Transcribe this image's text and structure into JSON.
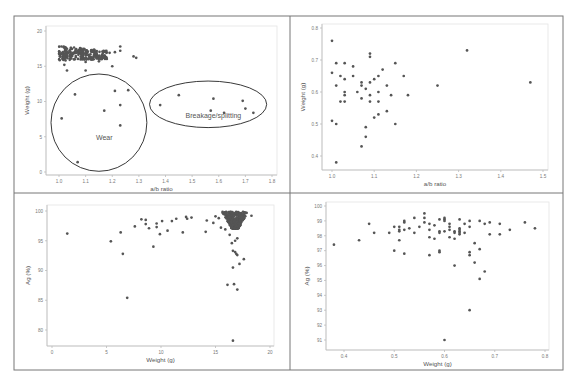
{
  "figure": {
    "layout": "2x2 grid of scatter plots",
    "frame": {
      "left": 14,
      "top": 16,
      "right": 563,
      "bottom": 370,
      "mid_x": 290,
      "mid_y": 193
    },
    "marker_color": "#555555",
    "axis_color": "#bbbbbb",
    "tick_text_color": "#777777",
    "label_color": "#555555"
  },
  "chart_data": [
    {
      "id": "panel-1",
      "type": "scatter",
      "title": "",
      "xlabel": "a/b ratio",
      "ylabel": "Weight (g)",
      "xlim": [
        0.98,
        1.82
      ],
      "ylim": [
        -0.5,
        20.5
      ],
      "xticks": [
        1.0,
        1.1,
        1.2,
        1.3,
        1.4,
        1.5,
        1.6,
        1.7,
        1.8
      ],
      "xtick_labels": [
        "1.0",
        "1.1",
        "1.2",
        "1.3",
        "1.4",
        "1.5",
        "1.6",
        "1.7",
        "1.8"
      ],
      "yticks": [
        0,
        5,
        10,
        15,
        20
      ],
      "ytick_labels": [
        "0",
        "5",
        "10",
        "15",
        "20"
      ],
      "grid": false,
      "plot_box": {
        "x0": 46,
        "x1": 277,
        "y0": 26,
        "y1": 175,
        "xpx": [
          59,
          272
        ],
        "ypx": [
          172,
          31
        ]
      },
      "dense_cluster": {
        "x_range": [
          1.0,
          1.18
        ],
        "y_range": [
          15.8,
          17.9
        ],
        "note": "dense overlapping cluster of many points"
      },
      "points": [
        [
          1.02,
          15.2
        ],
        [
          1.03,
          14.4
        ],
        [
          1.1,
          15.6
        ],
        [
          1.1,
          14.4
        ],
        [
          1.15,
          15.7
        ],
        [
          1.2,
          15.0
        ],
        [
          1.21,
          17.0
        ],
        [
          1.23,
          17.8
        ],
        [
          1.23,
          17.2
        ],
        [
          1.28,
          16.4
        ],
        [
          1.29,
          16.2
        ],
        [
          1.19,
          16.9
        ],
        [
          1.06,
          11.0
        ],
        [
          1.01,
          7.6
        ],
        [
          1.07,
          1.4
        ],
        [
          1.17,
          8.7
        ],
        [
          1.21,
          11.5
        ],
        [
          1.26,
          11.6
        ],
        [
          1.23,
          9.5
        ],
        [
          1.23,
          6.6
        ],
        [
          1.38,
          9.5
        ],
        [
          1.45,
          10.9
        ],
        [
          1.57,
          8.7
        ],
        [
          1.58,
          10.4
        ],
        [
          1.62,
          8.4
        ],
        [
          1.69,
          10.1
        ],
        [
          1.7,
          9.0
        ],
        [
          1.73,
          8.4
        ]
      ],
      "annotations": [
        {
          "shape": "ellipse",
          "label": "Wear",
          "cx": 1.15,
          "cy": 7.0,
          "rx": 0.18,
          "ry": 6.9,
          "label_at": [
            1.17,
            4.6
          ]
        },
        {
          "shape": "ellipse",
          "label": "Breakage/splitting",
          "cx": 1.56,
          "cy": 9.6,
          "rx": 0.22,
          "ry": 3.3,
          "label_at": [
            1.58,
            7.6
          ]
        }
      ]
    },
    {
      "id": "panel-2",
      "type": "scatter",
      "title": "",
      "xlabel": "a/b ratio",
      "ylabel": "Weight (g)",
      "xlim": [
        0.98,
        1.51
      ],
      "ylim": [
        0.36,
        0.81
      ],
      "xticks": [
        1.0,
        1.1,
        1.2,
        1.3,
        1.4,
        1.5
      ],
      "xtick_labels": [
        "1.0",
        "1.1",
        "1.2",
        "1.3",
        "1.4",
        "1.5"
      ],
      "yticks": [
        0.4,
        0.5,
        0.6,
        0.7,
        0.8
      ],
      "ytick_labels": [
        "0.4",
        "0.5",
        "0.6",
        "0.7",
        "0.8"
      ],
      "grid": false,
      "plot_box": {
        "x0": 322,
        "x1": 548,
        "y0": 24,
        "y1": 170,
        "xpx": [
          332,
          543
        ],
        "ypx": [
          156,
          28
        ]
      },
      "points": [
        [
          1.0,
          0.76
        ],
        [
          1.0,
          0.66
        ],
        [
          1.0,
          0.51
        ],
        [
          1.01,
          0.69
        ],
        [
          1.01,
          0.62
        ],
        [
          1.01,
          0.5
        ],
        [
          1.01,
          0.38
        ],
        [
          1.02,
          0.65
        ],
        [
          1.02,
          0.57
        ],
        [
          1.03,
          0.69
        ],
        [
          1.03,
          0.64
        ],
        [
          1.03,
          0.6
        ],
        [
          1.03,
          0.59
        ],
        [
          1.03,
          0.57
        ],
        [
          1.05,
          0.68
        ],
        [
          1.05,
          0.65
        ],
        [
          1.06,
          0.6
        ],
        [
          1.07,
          0.63
        ],
        [
          1.07,
          0.62
        ],
        [
          1.07,
          0.58
        ],
        [
          1.07,
          0.43
        ],
        [
          1.08,
          0.61
        ],
        [
          1.08,
          0.49
        ],
        [
          1.08,
          0.46
        ],
        [
          1.09,
          0.72
        ],
        [
          1.09,
          0.71
        ],
        [
          1.09,
          0.63
        ],
        [
          1.09,
          0.59
        ],
        [
          1.09,
          0.57
        ],
        [
          1.1,
          0.64
        ],
        [
          1.1,
          0.52
        ],
        [
          1.11,
          0.65
        ],
        [
          1.11,
          0.6
        ],
        [
          1.11,
          0.57
        ],
        [
          1.11,
          0.53
        ],
        [
          1.12,
          0.67
        ],
        [
          1.13,
          0.62
        ],
        [
          1.13,
          0.54
        ],
        [
          1.14,
          0.59
        ],
        [
          1.15,
          0.69
        ],
        [
          1.15,
          0.5
        ],
        [
          1.17,
          0.65
        ],
        [
          1.18,
          0.59
        ],
        [
          1.25,
          0.62
        ],
        [
          1.32,
          0.73
        ],
        [
          1.47,
          0.63
        ]
      ]
    },
    {
      "id": "panel-3",
      "type": "scatter",
      "title": "",
      "xlabel": "Weight (g)",
      "ylabel": "Ag (%)",
      "xlim": [
        -0.5,
        20.3
      ],
      "ylim": [
        77.5,
        101.2
      ],
      "xticks": [
        0,
        5,
        10,
        15,
        20
      ],
      "xtick_labels": [
        "0",
        "5",
        "10",
        "15",
        "20"
      ],
      "yticks": [
        80,
        85,
        90,
        95,
        100
      ],
      "ytick_labels": [
        "80",
        "85",
        "90",
        "95",
        "100"
      ],
      "grid": false,
      "plot_box": {
        "x0": 47,
        "x1": 274,
        "y0": 205,
        "y1": 346,
        "xpx": [
          52,
          270
        ],
        "ypx": [
          330,
          211
        ]
      },
      "dense_cluster": {
        "x_range": [
          15.7,
          17.6
        ],
        "y_range": [
          97.0,
          99.9
        ],
        "note": "dense overlapping cluster of many points"
      },
      "points": [
        [
          1.4,
          96.2
        ],
        [
          5.4,
          94.9
        ],
        [
          6.3,
          96.4
        ],
        [
          6.5,
          92.8
        ],
        [
          6.9,
          85.4
        ],
        [
          7.6,
          97.4
        ],
        [
          8.2,
          98.6
        ],
        [
          8.6,
          98.5
        ],
        [
          8.6,
          97.8
        ],
        [
          8.9,
          97.1
        ],
        [
          9.3,
          94.0
        ],
        [
          9.6,
          97.9
        ],
        [
          9.6,
          97.3
        ],
        [
          9.9,
          96.1
        ],
        [
          10.1,
          98.3
        ],
        [
          10.6,
          96.7
        ],
        [
          11.0,
          98.3
        ],
        [
          11.4,
          98.7
        ],
        [
          12.0,
          96.4
        ],
        [
          12.3,
          99.0
        ],
        [
          12.4,
          98.7
        ],
        [
          12.8,
          98.9
        ],
        [
          14.1,
          96.5
        ],
        [
          14.2,
          98.4
        ],
        [
          14.8,
          98.0
        ],
        [
          15.0,
          99.1
        ],
        [
          15.3,
          98.8
        ],
        [
          15.5,
          97.2
        ],
        [
          15.9,
          96.9
        ],
        [
          16.3,
          96.0
        ],
        [
          16.5,
          94.6
        ],
        [
          16.6,
          93.3
        ],
        [
          16.8,
          93.1
        ],
        [
          16.9,
          92.8
        ],
        [
          17.0,
          92.6
        ],
        [
          17.0,
          95.4
        ],
        [
          16.8,
          95.0
        ],
        [
          17.6,
          91.9
        ],
        [
          17.2,
          91.1
        ],
        [
          16.6,
          90.5
        ],
        [
          16.1,
          87.6
        ],
        [
          16.7,
          87.7
        ],
        [
          17.0,
          86.8
        ],
        [
          16.6,
          78.2
        ],
        [
          18.3,
          99.2
        ]
      ]
    },
    {
      "id": "panel-4",
      "type": "scatter",
      "title": "",
      "xlabel": "Weight (g)",
      "ylabel": "Ag (%)",
      "xlim": [
        0.36,
        0.81
      ],
      "ylim": [
        90.5,
        100.3
      ],
      "xticks": [
        0.4,
        0.5,
        0.6,
        0.7,
        0.8
      ],
      "xtick_labels": [
        "0.4",
        "0.5",
        "0.6",
        "0.7",
        "0.8"
      ],
      "yticks": [
        91,
        92,
        93,
        94,
        95,
        96,
        97,
        98,
        99,
        100
      ],
      "ytick_labels": [
        "91",
        "92",
        "93",
        "94",
        "95",
        "96",
        "97",
        "98",
        "99",
        "100"
      ],
      "grid": false,
      "plot_box": {
        "x0": 326,
        "x1": 549,
        "y0": 202,
        "y1": 350,
        "xpx": [
          344,
          545
        ],
        "ypx": [
          340,
          206
        ]
      },
      "points": [
        [
          0.38,
          97.4
        ],
        [
          0.43,
          97.7
        ],
        [
          0.45,
          98.8
        ],
        [
          0.46,
          98.2
        ],
        [
          0.49,
          98.2
        ],
        [
          0.5,
          98.6
        ],
        [
          0.5,
          97.0
        ],
        [
          0.51,
          98.6
        ],
        [
          0.51,
          98.4
        ],
        [
          0.51,
          98.3
        ],
        [
          0.51,
          97.7
        ],
        [
          0.52,
          99.0
        ],
        [
          0.52,
          98.9
        ],
        [
          0.52,
          98.4
        ],
        [
          0.52,
          96.8
        ],
        [
          0.53,
          98.5
        ],
        [
          0.54,
          99.2
        ],
        [
          0.54,
          98.2
        ],
        [
          0.55,
          98.6
        ],
        [
          0.56,
          99.5
        ],
        [
          0.56,
          99.2
        ],
        [
          0.56,
          98.9
        ],
        [
          0.57,
          98.8
        ],
        [
          0.57,
          98.4
        ],
        [
          0.57,
          97.9
        ],
        [
          0.57,
          96.7
        ],
        [
          0.58,
          98.7
        ],
        [
          0.58,
          97.8
        ],
        [
          0.59,
          99.1
        ],
        [
          0.59,
          98.3
        ],
        [
          0.59,
          98.2
        ],
        [
          0.59,
          97.0
        ],
        [
          0.59,
          96.9
        ],
        [
          0.6,
          99.2
        ],
        [
          0.6,
          99.1
        ],
        [
          0.6,
          99.0
        ],
        [
          0.6,
          98.3
        ],
        [
          0.6,
          91.0
        ],
        [
          0.61,
          98.8
        ],
        [
          0.61,
          98.6
        ],
        [
          0.61,
          98.4
        ],
        [
          0.61,
          97.9
        ],
        [
          0.62,
          98.3
        ],
        [
          0.62,
          98.2
        ],
        [
          0.62,
          97.8
        ],
        [
          0.62,
          96.0
        ],
        [
          0.63,
          99.1
        ],
        [
          0.63,
          98.5
        ],
        [
          0.63,
          98.4
        ],
        [
          0.63,
          98.3
        ],
        [
          0.63,
          98.2
        ],
        [
          0.63,
          98.1
        ],
        [
          0.64,
          98.8
        ],
        [
          0.64,
          98.2
        ],
        [
          0.65,
          99.0
        ],
        [
          0.65,
          98.6
        ],
        [
          0.65,
          96.9
        ],
        [
          0.65,
          96.7
        ],
        [
          0.65,
          93.0
        ],
        [
          0.66,
          97.5
        ],
        [
          0.66,
          96.2
        ],
        [
          0.67,
          99.0
        ],
        [
          0.67,
          97.1
        ],
        [
          0.67,
          95.1
        ],
        [
          0.68,
          98.8
        ],
        [
          0.68,
          95.6
        ],
        [
          0.69,
          98.9
        ],
        [
          0.69,
          98.1
        ],
        [
          0.71,
          98.8
        ],
        [
          0.71,
          98.1
        ],
        [
          0.73,
          98.4
        ],
        [
          0.76,
          98.9
        ],
        [
          0.78,
          98.5
        ]
      ]
    }
  ]
}
